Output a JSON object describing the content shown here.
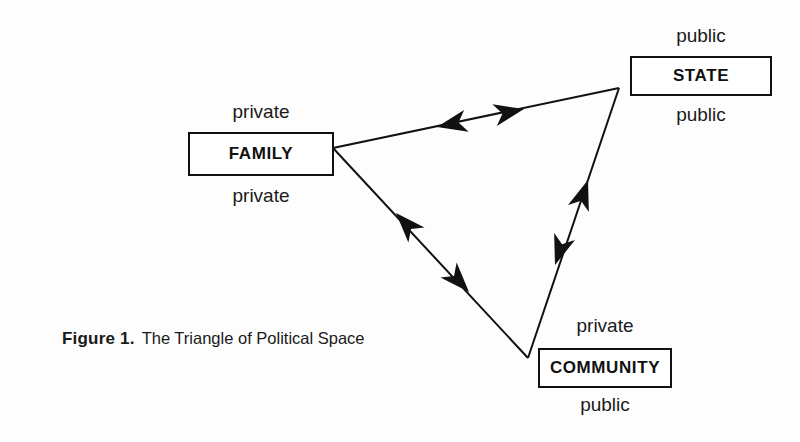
{
  "figure": {
    "caption_prefix": "Figure 1.",
    "caption_text": "The Triangle of Political Space",
    "background_color": "#fdfdfd",
    "ink_color": "#111111"
  },
  "nodes": [
    {
      "id": "family",
      "label": "FAMILY",
      "label_above": "private",
      "label_below": "private",
      "x": 188,
      "y": 132,
      "width": 146,
      "height": 44
    },
    {
      "id": "state",
      "label": "STATE",
      "label_above": "public",
      "label_below": "public",
      "x": 630,
      "y": 56,
      "width": 142,
      "height": 40
    },
    {
      "id": "community",
      "label": "COMMUNITY",
      "label_above": "private",
      "label_below": "public",
      "x": 538,
      "y": 348,
      "width": 134,
      "height": 40
    }
  ],
  "diagram": {
    "type": "triangle",
    "vertices": [
      {
        "name": "family-vertex",
        "x": 333,
        "y": 148
      },
      {
        "name": "state-vertex",
        "x": 619,
        "y": 88
      },
      {
        "name": "community-vertex",
        "x": 528,
        "y": 358
      }
    ],
    "edges": [
      {
        "from": "family",
        "to": "state",
        "direction": "bidirectional"
      },
      {
        "from": "state",
        "to": "community",
        "direction": "bidirectional"
      },
      {
        "from": "community",
        "to": "family",
        "direction": "bidirectional"
      }
    ]
  }
}
